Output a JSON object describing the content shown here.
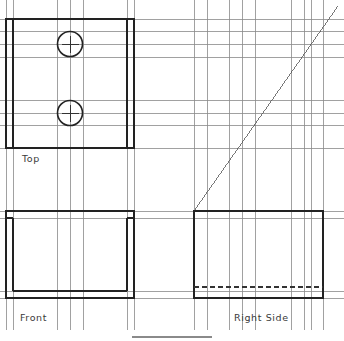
{
  "canvas": {
    "width": 344,
    "height": 341,
    "background": "#ffffff",
    "title": "Orthographic Projection Layout"
  },
  "style": {
    "object_line_color": "#222222",
    "object_line_width": 1.6,
    "projection_line_color": "#8a8a8a",
    "projection_line_width": 0.8,
    "miter_line_color": "#555555",
    "miter_line_width": 0.8,
    "hidden_line_color": "#333333",
    "hidden_line_dash": "5,3",
    "center_mark_color": "#333333",
    "label_color": "#3a3a3a",
    "label_font_size": 9.5
  },
  "labels": {
    "top": "Top",
    "front": "Front",
    "right_side": "Right  Side"
  },
  "label_positions": {
    "top": {
      "x": 22,
      "y": 162
    },
    "front": {
      "x": 20,
      "y": 321
    },
    "right_side": {
      "x": 234,
      "y": 321
    }
  },
  "views": {
    "top_view": {
      "name": "Top",
      "outer": {
        "x": 6,
        "y": 19,
        "width": 128,
        "height": 129
      },
      "inner_left_edge_x": 13,
      "inner_right_edge_x": 127,
      "holes": [
        {
          "cx": 70,
          "cy": 44,
          "r": 12.5,
          "center_mark_len": 17
        },
        {
          "cx": 70,
          "cy": 113,
          "r": 12.5,
          "center_mark_len": 17
        }
      ]
    },
    "front_view": {
      "name": "Front",
      "outer": {
        "x": 6,
        "y": 211,
        "width": 128,
        "height": 87
      },
      "inner_left_edge_x": 13,
      "inner_right_edge_x": 127,
      "inner_top_y": 218,
      "notch_bottom_y": 291
    },
    "right_side_view": {
      "name": "Right Side",
      "outer": {
        "x": 194,
        "y": 211,
        "width": 129,
        "height": 87
      },
      "hidden_line_y": 287
    }
  },
  "miter_line": {
    "from": {
      "x": 194,
      "y": 211
    },
    "to": {
      "x": 338,
      "y": 6
    },
    "angle_deg": 45,
    "description": "45 degree projection/miter line"
  },
  "projection": {
    "horizontal_lines_y": [
      19,
      31,
      44,
      57,
      100,
      113,
      125,
      148,
      211,
      218,
      291,
      298
    ],
    "vertical_lines_x": [
      6,
      13,
      57,
      70,
      83,
      127,
      134,
      194,
      207,
      229,
      242,
      255,
      291,
      304,
      311,
      323
    ],
    "vertical_top_y": 0,
    "horizontal_right_x": 344
  },
  "bottom_rule": {
    "x1": 132,
    "y1": 337,
    "x2": 212,
    "y2": 337
  }
}
